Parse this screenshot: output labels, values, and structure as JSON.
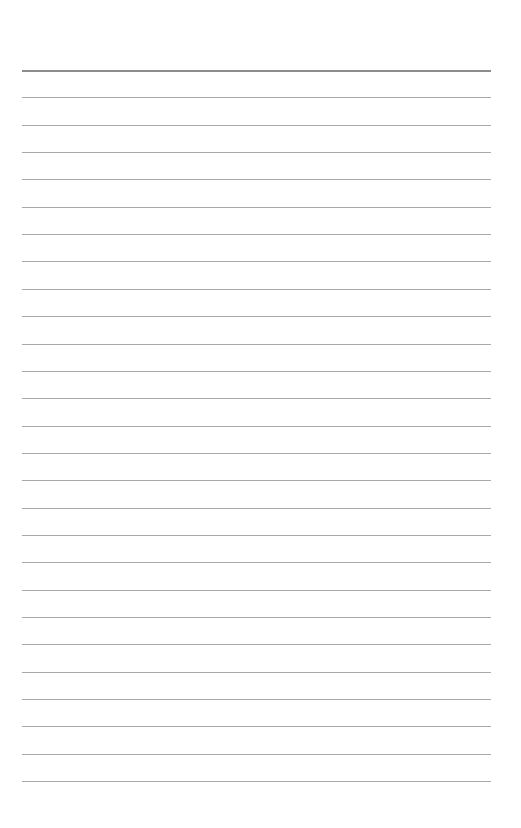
{
  "page": {
    "type": "lined-paper",
    "background_color": "#ffffff",
    "rule_color": "#a9a9a9",
    "top_rule_color": "#8c8c8c",
    "rule_left": 22,
    "rule_right": 491,
    "first_rule_y": 70,
    "rule_spacing": 27.35,
    "rule_count": 27
  }
}
